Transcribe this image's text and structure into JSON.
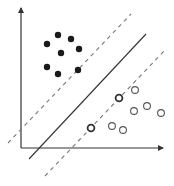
{
  "diagram": {
    "type": "svm-maximum-margin",
    "colors": {
      "background": "#ffffff",
      "ink": "#333333",
      "dashed": "#777777",
      "filled": "#1a1a1a",
      "open_stroke": "#555555",
      "support_stroke": "#333333"
    },
    "axes": {
      "origin": [
        21,
        148
      ],
      "x_end": [
        163,
        148
      ],
      "y_end": [
        21,
        8
      ]
    },
    "hyperplane": {
      "x1": 29,
      "y1": 159,
      "x2": 146,
      "y2": 34
    },
    "margins": [
      {
        "name": "upper-margin",
        "x1": 8,
        "y1": 143,
        "x2": 131,
        "y2": 14
      },
      {
        "name": "lower-margin",
        "x1": 45,
        "y1": 176,
        "x2": 166,
        "y2": 49
      }
    ],
    "class_a_filled": [
      [
        47,
        44
      ],
      [
        58,
        35
      ],
      [
        71,
        39
      ],
      [
        61,
        53
      ],
      [
        79,
        49
      ],
      [
        47,
        67
      ],
      [
        58,
        74
      ],
      [
        78,
        70
      ]
    ],
    "class_b_open": [
      [
        135,
        90
      ],
      [
        119,
        98
      ],
      [
        134,
        111
      ],
      [
        147,
        106
      ],
      [
        161,
        113
      ],
      [
        91,
        128
      ],
      [
        112,
        126
      ],
      [
        123,
        130
      ]
    ],
    "support_vectors_open": [
      [
        119,
        98
      ],
      [
        91,
        128
      ]
    ]
  }
}
